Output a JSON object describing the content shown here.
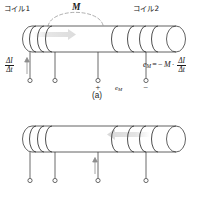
{
  "figure": {
    "colors": {
      "ink": "#1a1a1a",
      "coil_line": "#2b2b2b",
      "flux_arrow": "#d8d8d8",
      "lead_line": "#3a3a3a"
    }
  },
  "panels": [
    {
      "id": "a",
      "caption": "(a)",
      "labels": {
        "coil1": "コイル1",
        "coil2": "コイル2",
        "mutual": "M"
      },
      "rate": {
        "numerator": "ΔI",
        "denominator": "Δt",
        "arrow_direction": "up"
      },
      "flux_arrow_direction": "right",
      "terminals": [
        {
          "index": 1,
          "sign": ""
        },
        {
          "index": 2,
          "sign": ""
        },
        {
          "index": 3,
          "sign": "+"
        },
        {
          "index": 4,
          "sign": "−"
        }
      ],
      "emf_label": "e",
      "emf_subscript": "M",
      "equation": {
        "lhs": "e",
        "lhs_sub": "M",
        "eq": "=",
        "sign": "−",
        "coefficient": "M",
        "dot": "·",
        "numerator": "ΔI",
        "denominator": "Δt"
      }
    },
    {
      "id": "b",
      "caption": "(b)",
      "labels": {
        "coil1": "",
        "coil2": "",
        "mutual": ""
      },
      "rate": {
        "numerator": "ΔI",
        "denominator": "Δt",
        "arrow_direction": "up"
      },
      "flux_arrow_direction": "left",
      "terminals": [
        {
          "index": 1,
          "sign": "+"
        },
        {
          "index": 2,
          "sign": "−"
        },
        {
          "index": 3,
          "sign": ""
        },
        {
          "index": 4,
          "sign": ""
        }
      ],
      "emf_label": "e",
      "emf_subscript": "M",
      "equation": {
        "lhs": "e",
        "lhs_sub": "M",
        "eq": "=",
        "sign": "−",
        "coefficient": "M",
        "dot": "·",
        "numerator": "ΔI",
        "denominator": "Δt"
      }
    }
  ]
}
